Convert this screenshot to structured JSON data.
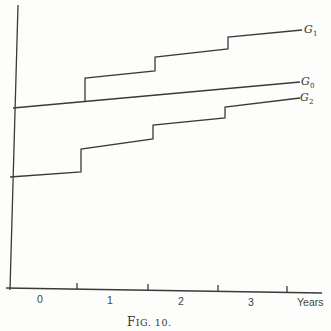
{
  "figure": {
    "caption_big": "F",
    "caption_small": "IG. 10.",
    "x_axis": {
      "unit_label": "Years",
      "tick_labels": [
        "0",
        "1",
        "2",
        "3"
      ]
    },
    "curves": [
      {
        "name": "G",
        "subscript": "1"
      },
      {
        "name": "G",
        "subscript": "0"
      },
      {
        "name": "G",
        "subscript": "2"
      }
    ],
    "colors": {
      "line": "#3a3a3a",
      "background": "#fdfdfb"
    }
  }
}
